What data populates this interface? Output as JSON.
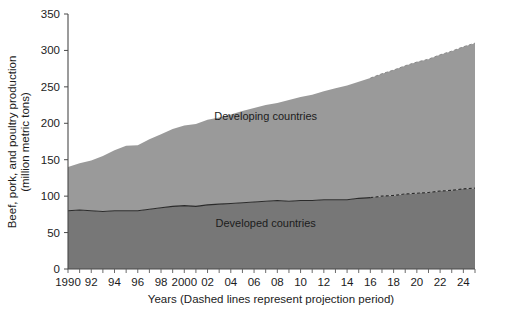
{
  "chart_data": {
    "type": "area",
    "stacked": true,
    "title": "",
    "xlabel": "Years (Dashed lines represent projection period)",
    "ylabel": "Beef, pork, and poultry production (million metric tons)",
    "ylim": [
      0,
      350
    ],
    "ytick_values": [
      0,
      50,
      100,
      150,
      200,
      250,
      300,
      350
    ],
    "ytick_labels": [
      "0",
      "50",
      "100",
      "150",
      "200",
      "250",
      "300",
      "350"
    ],
    "xlim": [
      1990,
      2025
    ],
    "x": [
      1990,
      1991,
      1992,
      1993,
      1994,
      1995,
      1996,
      1997,
      1998,
      1999,
      2000,
      2001,
      2002,
      2003,
      2004,
      2005,
      2006,
      2007,
      2008,
      2009,
      2010,
      2011,
      2012,
      2013,
      2014,
      2015,
      2016,
      2017,
      2018,
      2019,
      2020,
      2021,
      2022,
      2023,
      2024,
      2025
    ],
    "xtick_values": [
      1990,
      1992,
      1994,
      1996,
      1998,
      2000,
      2002,
      2004,
      2006,
      2008,
      2010,
      2012,
      2014,
      2016,
      2018,
      2020,
      2022,
      2024
    ],
    "xtick_labels": [
      "1990",
      "92",
      "94",
      "96",
      "98",
      "2000",
      "02",
      "04",
      "06",
      "08",
      "10",
      "12",
      "14",
      "16",
      "18",
      "20",
      "22",
      "24"
    ],
    "minor_tick_interval": 1,
    "grid": false,
    "legend_position": "inline-annotations",
    "projection_start_year": 2016,
    "series": [
      {
        "name": "Developed countries",
        "color": "#777777",
        "label_text": "Developed countries",
        "values": [
          80,
          81,
          80,
          79,
          80,
          80,
          80,
          82,
          84,
          86,
          87,
          86,
          88,
          89,
          90,
          91,
          92,
          93,
          94,
          93,
          94,
          94,
          95,
          95,
          95,
          97,
          98,
          100,
          101,
          103,
          104,
          105,
          107,
          108,
          110,
          111
        ]
      },
      {
        "name": "Developing countries",
        "color": "#9a9a9a",
        "label_text": "Developing countries",
        "values": [
          60,
          64,
          69,
          76,
          83,
          89,
          90,
          96,
          101,
          106,
          110,
          113,
          117,
          119,
          122,
          126,
          129,
          132,
          134,
          139,
          142,
          145,
          149,
          153,
          157,
          160,
          164,
          168,
          172,
          176,
          180,
          183,
          187,
          191,
          195,
          199
        ]
      }
    ],
    "totals": [
      140,
      145,
      149,
      155,
      163,
      169,
      170,
      178,
      185,
      192,
      197,
      199,
      205,
      208,
      212,
      217,
      221,
      225,
      228,
      232,
      236,
      239,
      244,
      248,
      252,
      257,
      262,
      268,
      273,
      279,
      284,
      288,
      294,
      299,
      305,
      310
    ],
    "annotations": [
      {
        "text": "Developing countries",
        "x_year": 2007,
        "y_value": 205
      },
      {
        "text": "Developed countries",
        "x_year": 2007,
        "y_value": 58
      }
    ]
  },
  "axes": {
    "y_title_line1": "Beef, pork, and poultry production",
    "y_title_line2": "(million metric tons)",
    "x_title": "Years (Dashed lines represent projection period)"
  }
}
